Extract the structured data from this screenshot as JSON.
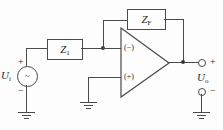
{
  "figure": {
    "type": "schematic",
    "line_color": "#4a4a4a",
    "text_color": "#2b2b2b",
    "background": "#fdfdfd"
  },
  "source": {
    "symbol": "ac-voltage-source",
    "glyph": "~",
    "label": "U",
    "subscript": "i",
    "plus": "+",
    "minus": "−"
  },
  "input_impedance": {
    "label": "Z",
    "subscript": "1"
  },
  "feedback_impedance": {
    "label": "Z",
    "subscript": "F"
  },
  "opamp": {
    "inverting_input": "(−)",
    "noninverting_input": "(+)"
  },
  "output": {
    "label": "U",
    "subscript": "o",
    "plus": "+",
    "minus": "−"
  },
  "grounds": [
    {
      "name": "source-ground"
    },
    {
      "name": "noninverting-ground"
    },
    {
      "name": "output-ground"
    }
  ]
}
